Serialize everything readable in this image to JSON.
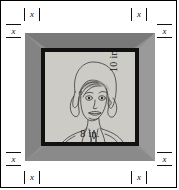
{
  "figure": {
    "photo": {
      "width_label": "8 in.",
      "height_label": "10 in.",
      "subject": "line-drawing portrait of a woman"
    },
    "frame": {
      "color": "#8f8f8f",
      "mat_color": "#111111",
      "photo_background": "#cdcbc6"
    },
    "x_labels": {
      "top": "x",
      "bottom": "x",
      "left": "x",
      "right": "x",
      "top_left_side": "x",
      "top_right_side": "x",
      "bottom_left_side": "x",
      "bottom_right_side": "x"
    }
  }
}
